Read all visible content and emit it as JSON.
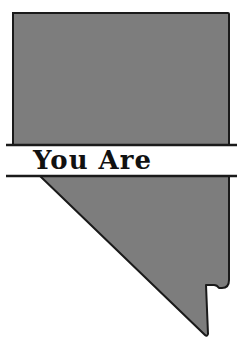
{
  "graphic": {
    "subject": "Nevada state outline",
    "banner_text": "You Are",
    "colors": {
      "fill": "#7d7d7d",
      "stroke": "#1a1a1a",
      "background": "#ffffff",
      "text": "#111111"
    }
  }
}
